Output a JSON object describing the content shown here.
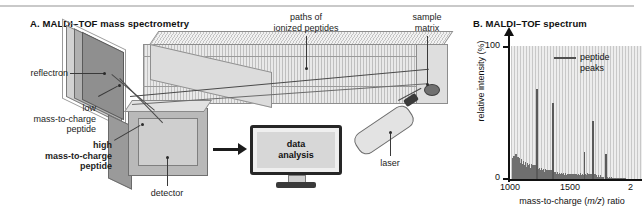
{
  "panels": {
    "a": {
      "title": "A.  MALDI–TOF mass spectrometry",
      "labels": {
        "reflectron": "reflectron",
        "paths": "paths of\nionized peptides",
        "sample_matrix": "sample\nmatrix",
        "low_mz": "low\nmass-to-charge\npeptide",
        "high_mz": "high\nmass-to-charge\npeptide",
        "detector": "detector",
        "laser": "laser",
        "data_analysis": "data\nanalysis"
      }
    },
    "b": {
      "title": "B.  MALDI–TOF spectrum",
      "legend": "peptide\npeaks"
    }
  },
  "chart_data": {
    "type": "line",
    "title": "MALDI–TOF spectrum",
    "xlabel": "mass-to-charge (m/z) ratio",
    "ylabel": "relative intensity (%)",
    "xlim": [
      1000,
      2100
    ],
    "ylim": [
      0,
      108
    ],
    "xticks": [
      1000,
      1500,
      2000
    ],
    "xtick_labels": [
      "1000",
      "1500",
      "2"
    ],
    "yticks": [
      0,
      100
    ],
    "ytick_labels": [
      "0",
      "100"
    ],
    "grid": true,
    "legend_position": "top-right",
    "legend_entries": [
      "peptide peaks"
    ],
    "peaks": [
      {
        "mz": 1210,
        "intensity": 73
      },
      {
        "mz": 1345,
        "intensity": 62
      },
      {
        "mz": 1610,
        "intensity": 22
      },
      {
        "mz": 1680,
        "intensity": 47
      },
      {
        "mz": 1790,
        "intensity": 20
      }
    ],
    "baseline_noise": [
      {
        "mz": 1012,
        "intensity": 17
      },
      {
        "mz": 1020,
        "intensity": 19
      },
      {
        "mz": 1028,
        "intensity": 16
      },
      {
        "mz": 1036,
        "intensity": 20
      },
      {
        "mz": 1044,
        "intensity": 15
      },
      {
        "mz": 1052,
        "intensity": 18
      },
      {
        "mz": 1060,
        "intensity": 14
      },
      {
        "mz": 1068,
        "intensity": 17
      },
      {
        "mz": 1076,
        "intensity": 13
      },
      {
        "mz": 1084,
        "intensity": 16
      },
      {
        "mz": 1092,
        "intensity": 12
      },
      {
        "mz": 1100,
        "intensity": 15
      },
      {
        "mz": 1108,
        "intensity": 11
      },
      {
        "mz": 1116,
        "intensity": 14
      },
      {
        "mz": 1124,
        "intensity": 10
      },
      {
        "mz": 1132,
        "intensity": 13
      },
      {
        "mz": 1140,
        "intensity": 11
      },
      {
        "mz": 1148,
        "intensity": 12
      },
      {
        "mz": 1156,
        "intensity": 9
      },
      {
        "mz": 1164,
        "intensity": 12
      },
      {
        "mz": 1172,
        "intensity": 10
      },
      {
        "mz": 1180,
        "intensity": 11
      },
      {
        "mz": 1188,
        "intensity": 9
      },
      {
        "mz": 1196,
        "intensity": 11
      },
      {
        "mz": 1204,
        "intensity": 8
      },
      {
        "mz": 1218,
        "intensity": 10
      },
      {
        "mz": 1226,
        "intensity": 8
      },
      {
        "mz": 1234,
        "intensity": 9
      },
      {
        "mz": 1242,
        "intensity": 7
      },
      {
        "mz": 1250,
        "intensity": 9
      },
      {
        "mz": 1258,
        "intensity": 7
      },
      {
        "mz": 1266,
        "intensity": 8
      },
      {
        "mz": 1274,
        "intensity": 6
      },
      {
        "mz": 1282,
        "intensity": 8
      },
      {
        "mz": 1290,
        "intensity": 6
      },
      {
        "mz": 1298,
        "intensity": 7
      },
      {
        "mz": 1306,
        "intensity": 6
      },
      {
        "mz": 1314,
        "intensity": 7
      },
      {
        "mz": 1322,
        "intensity": 5
      },
      {
        "mz": 1330,
        "intensity": 7
      },
      {
        "mz": 1354,
        "intensity": 6
      },
      {
        "mz": 1362,
        "intensity": 5
      },
      {
        "mz": 1370,
        "intensity": 6
      },
      {
        "mz": 1378,
        "intensity": 4
      },
      {
        "mz": 1386,
        "intensity": 6
      },
      {
        "mz": 1394,
        "intensity": 4
      },
      {
        "mz": 1402,
        "intensity": 5
      },
      {
        "mz": 1410,
        "intensity": 4
      },
      {
        "mz": 1418,
        "intensity": 5
      },
      {
        "mz": 1426,
        "intensity": 4
      },
      {
        "mz": 1434,
        "intensity": 5
      },
      {
        "mz": 1442,
        "intensity": 3
      },
      {
        "mz": 1450,
        "intensity": 5
      },
      {
        "mz": 1458,
        "intensity": 3
      },
      {
        "mz": 1466,
        "intensity": 4
      },
      {
        "mz": 1474,
        "intensity": 3
      },
      {
        "mz": 1482,
        "intensity": 4
      },
      {
        "mz": 1490,
        "intensity": 3
      },
      {
        "mz": 1498,
        "intensity": 4
      },
      {
        "mz": 1506,
        "intensity": 3
      },
      {
        "mz": 1514,
        "intensity": 4
      },
      {
        "mz": 1522,
        "intensity": 3
      },
      {
        "mz": 1530,
        "intensity": 4
      },
      {
        "mz": 1538,
        "intensity": 2
      },
      {
        "mz": 1546,
        "intensity": 4
      },
      {
        "mz": 1554,
        "intensity": 3
      },
      {
        "mz": 1562,
        "intensity": 4
      },
      {
        "mz": 1570,
        "intensity": 3
      },
      {
        "mz": 1578,
        "intensity": 5
      },
      {
        "mz": 1586,
        "intensity": 3
      },
      {
        "mz": 1594,
        "intensity": 4
      },
      {
        "mz": 1602,
        "intensity": 3
      },
      {
        "mz": 1618,
        "intensity": 4
      },
      {
        "mz": 1626,
        "intensity": 3
      },
      {
        "mz": 1634,
        "intensity": 5
      },
      {
        "mz": 1642,
        "intensity": 3
      },
      {
        "mz": 1650,
        "intensity": 4
      },
      {
        "mz": 1658,
        "intensity": 3
      },
      {
        "mz": 1666,
        "intensity": 4
      },
      {
        "mz": 1690,
        "intensity": 3
      },
      {
        "mz": 1698,
        "intensity": 4
      },
      {
        "mz": 1706,
        "intensity": 2
      },
      {
        "mz": 1714,
        "intensity": 3
      },
      {
        "mz": 1722,
        "intensity": 2
      },
      {
        "mz": 1730,
        "intensity": 3
      },
      {
        "mz": 1738,
        "intensity": 2
      },
      {
        "mz": 1746,
        "intensity": 3
      },
      {
        "mz": 1754,
        "intensity": 2
      },
      {
        "mz": 1762,
        "intensity": 2
      },
      {
        "mz": 1770,
        "intensity": 2
      },
      {
        "mz": 1798,
        "intensity": 2
      },
      {
        "mz": 1806,
        "intensity": 2
      },
      {
        "mz": 1814,
        "intensity": 1
      },
      {
        "mz": 1822,
        "intensity": 2
      },
      {
        "mz": 1830,
        "intensity": 1
      },
      {
        "mz": 1838,
        "intensity": 2
      },
      {
        "mz": 1846,
        "intensity": 1
      },
      {
        "mz": 1854,
        "intensity": 1
      },
      {
        "mz": 1862,
        "intensity": 1
      },
      {
        "mz": 1870,
        "intensity": 1
      },
      {
        "mz": 1878,
        "intensity": 1
      },
      {
        "mz": 1886,
        "intensity": 1
      },
      {
        "mz": 1894,
        "intensity": 1
      },
      {
        "mz": 1902,
        "intensity": 1
      },
      {
        "mz": 1910,
        "intensity": 1
      },
      {
        "mz": 1918,
        "intensity": 1
      },
      {
        "mz": 1926,
        "intensity": 1
      },
      {
        "mz": 1934,
        "intensity": 1
      },
      {
        "mz": 1942,
        "intensity": 1
      },
      {
        "mz": 1950,
        "intensity": 1
      }
    ]
  }
}
